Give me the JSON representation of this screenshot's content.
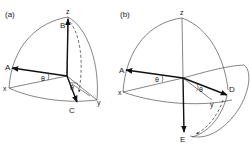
{
  "panels": [
    {
      "id": "a",
      "panel_label": "(a)",
      "labels": {
        "z": "z",
        "x": "x",
        "y": "y",
        "A": "A",
        "B": "B",
        "C": "C",
        "theta": "θ",
        "phi": "θ"
      }
    },
    {
      "id": "b",
      "panel_label": "(b)",
      "labels": {
        "z": "z",
        "x": "x",
        "y": "y",
        "A": "A",
        "D": "D",
        "E": "E",
        "theta": "θ",
        "phi": "θ"
      }
    }
  ],
  "colors": {
    "line": "#333333",
    "background": "#ffffff"
  }
}
